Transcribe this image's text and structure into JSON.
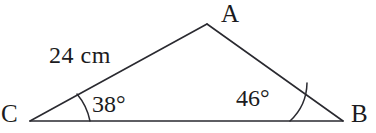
{
  "figure": {
    "kind": "triangle-diagram",
    "background_color": "#ffffff",
    "stroke_color": "#2a2a30",
    "text_color": "#1b1b20",
    "vertices": {
      "A": {
        "label": "A",
        "x": 207,
        "y": 24
      },
      "B": {
        "label": "B",
        "x": 343,
        "y": 121
      },
      "C": {
        "label": "C",
        "x": 30,
        "y": 121
      }
    },
    "labels": {
      "vertex_a": "A",
      "vertex_b": "B",
      "vertex_c": "C",
      "angle_c": "38°",
      "angle_b": "46°",
      "side_ca": "24 cm"
    },
    "angles": {
      "C": {
        "value": 38,
        "unit": "degrees",
        "text": "38°"
      },
      "B": {
        "value": 46,
        "unit": "degrees",
        "text": "46°"
      },
      "A": {
        "value": 96,
        "unit": "degrees",
        "text": ""
      }
    },
    "sides": {
      "CA": {
        "length": 24,
        "unit": "cm",
        "text": "24 cm"
      }
    },
    "geometry": {
      "side_ca_path": "M 30 121 L 207 24",
      "side_ab_path": "M 207 24 L 343 121",
      "side_cb_path": "M 30 121 L 343 121",
      "arc_c_path": "M 90 121 A 60 60 0 0 0 77 94",
      "arc_b_path": "M 290 121 A 53 53 0 0 0 307 83",
      "stroke_width": 1.6,
      "arc_stroke_width": 1.5
    }
  }
}
